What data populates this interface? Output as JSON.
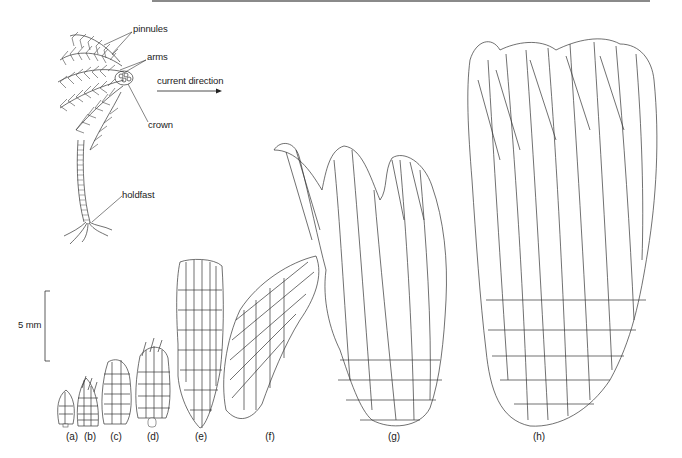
{
  "figure": {
    "crinoid_diagram": {
      "labels": {
        "pinnules": "pinnules",
        "arms": "arms",
        "crown": "crown",
        "holdfast": "holdfast"
      },
      "current_label": "current direction",
      "arrow_direction": "right"
    },
    "scale_bar": {
      "label": "5 mm",
      "orientation": "vertical"
    },
    "growth_stages": [
      {
        "id": "a",
        "label": "(a)",
        "x": 67
      },
      {
        "id": "b",
        "label": "(b)",
        "x": 89
      },
      {
        "id": "c",
        "label": "(c)",
        "x": 116
      },
      {
        "id": "d",
        "label": "(d)",
        "x": 152
      },
      {
        "id": "e",
        "label": "(e)",
        "x": 201
      },
      {
        "id": "f",
        "label": "(f)",
        "x": 270
      },
      {
        "id": "g",
        "label": "(g)",
        "x": 394
      },
      {
        "id": "h",
        "label": "(h)",
        "x": 540
      }
    ],
    "colors": {
      "line": "#333333",
      "background": "#ffffff",
      "rule": "#8a8a8a"
    }
  }
}
